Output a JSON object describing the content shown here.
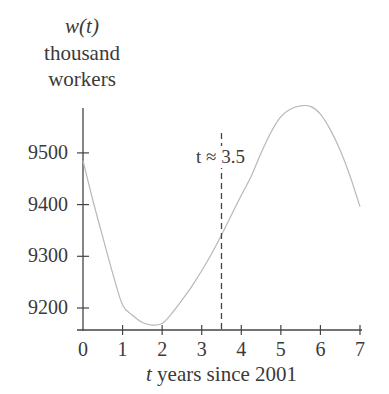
{
  "chart_data": {
    "type": "line",
    "title": "",
    "ylabel_lines": [
      "w(t)",
      "thousand",
      "workers"
    ],
    "xlabel_var": "t",
    "xlabel_rest": " years since 2001",
    "xlabel": "t years since 2001",
    "ylabel": "w(t) thousand workers",
    "x_ticks": [
      0,
      1,
      2,
      3,
      4,
      5,
      6,
      7
    ],
    "y_ticks": [
      9200,
      9300,
      9400,
      9500
    ],
    "xlim": [
      0,
      7
    ],
    "ylim": [
      9155,
      9600
    ],
    "grid": false,
    "legend": null,
    "series": [
      {
        "name": "w(t)",
        "color": "#b8b8b8",
        "x": [
          0,
          0.25,
          0.5,
          0.75,
          1,
          1.25,
          1.5,
          1.75,
          2,
          2.25,
          2.5,
          2.75,
          3,
          3.25,
          3.5,
          3.75,
          4,
          4.25,
          4.5,
          4.75,
          5,
          5.25,
          5.5,
          5.75,
          6,
          6.25,
          6.5,
          6.75,
          7
        ],
        "values": [
          9485,
          9408,
          9337,
          9267,
          9206,
          9186,
          9172,
          9167,
          9170,
          9190,
          9215,
          9242,
          9272,
          9305,
          9341,
          9380,
          9418,
          9455,
          9500,
          9540,
          9570,
          9585,
          9591,
          9590,
          9575,
          9545,
          9505,
          9455,
          9396
        ]
      }
    ],
    "annotations": [
      {
        "type": "vline",
        "x": 3.5,
        "style": "dashed",
        "label": "t ≈ 3.5"
      }
    ]
  }
}
